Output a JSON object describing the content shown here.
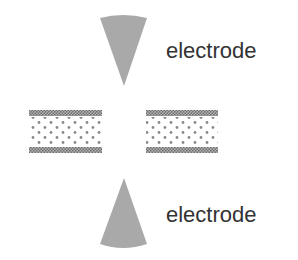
{
  "diagram": {
    "electrodes": [
      {
        "id": "top",
        "label": "electrode",
        "orientation": "pointing-down"
      },
      {
        "id": "bottom",
        "label": "electrode",
        "orientation": "pointing-up"
      }
    ],
    "blocks": [
      {
        "id": "left",
        "description": "layered block with dotted core"
      },
      {
        "id": "right",
        "description": "layered block with dotted core"
      }
    ],
    "colors": {
      "electrode_fill": "#a9a9a9",
      "stripe_fill": "#7f7f7f",
      "dot_fill": "#8a8a8a",
      "text": "#333333",
      "background": "#ffffff"
    }
  }
}
